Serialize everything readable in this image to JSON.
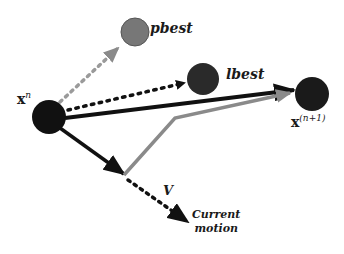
{
  "diagram": {
    "colors": {
      "node_dark": "#1a1a1a",
      "node_gray": "#777777",
      "arrow_dark": "#111111",
      "arrow_gray": "#8a8a8a",
      "dotted_gray": "#9a9a9a"
    },
    "nodes": [
      {
        "id": "xn",
        "label_base": "x",
        "label_sup": "n"
      },
      {
        "id": "pbest",
        "label": "pbest"
      },
      {
        "id": "lbest",
        "label": "lbest"
      },
      {
        "id": "xn1",
        "label_base": "x",
        "label_sup": "(n+1)"
      }
    ],
    "edges": [
      {
        "from": "xn",
        "to": "pbest",
        "style": "dotted-gray"
      },
      {
        "from": "xn",
        "to": "lbest",
        "style": "dotted-dark"
      },
      {
        "from": "xn",
        "to": "xn1",
        "style": "solid-dark"
      },
      {
        "from": "xn",
        "to": "v-point",
        "style": "solid-dark"
      },
      {
        "from": "v-point",
        "to": "xn1",
        "style": "solid-gray"
      },
      {
        "from": "v-point",
        "to": "current-motion",
        "style": "dotted-dark"
      }
    ],
    "labels": {
      "v": "V",
      "current_motion_line1": "Current",
      "current_motion_line2": "motion"
    }
  }
}
